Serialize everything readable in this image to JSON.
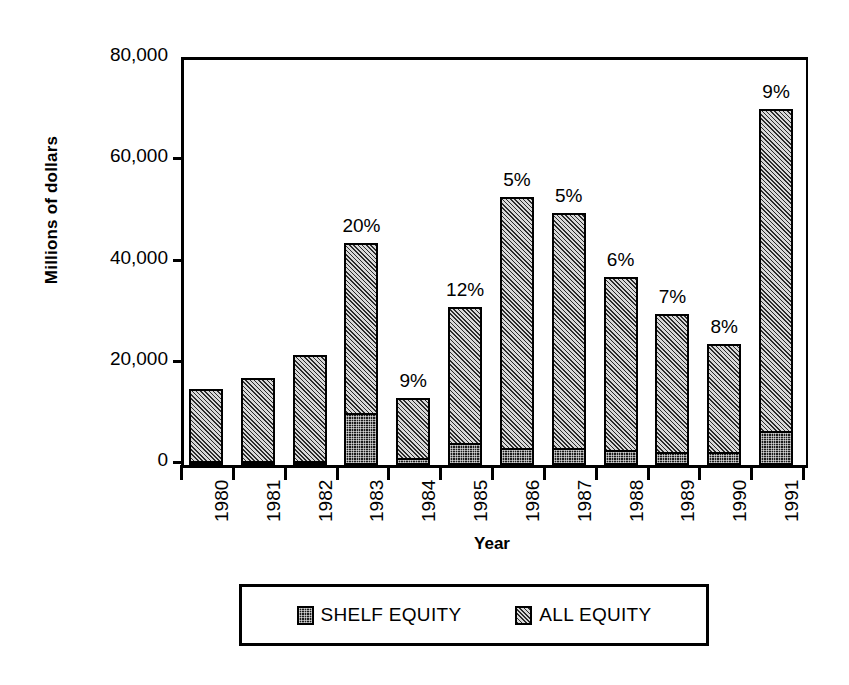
{
  "chart_data": {
    "type": "bar",
    "stacked": true,
    "title": "",
    "xlabel": "Year",
    "ylabel": "Millions of dollars",
    "categories": [
      "1980",
      "1981",
      "1982",
      "1983",
      "1984",
      "1985",
      "1986",
      "1987",
      "1988",
      "1989",
      "1990",
      "1991"
    ],
    "ylim": [
      0,
      80000
    ],
    "yticks": [
      0,
      20000,
      40000,
      60000,
      80000
    ],
    "ytick_labels": [
      "0",
      "20,000",
      "40,000",
      "60,000",
      "80,000"
    ],
    "grid": false,
    "legend_position": "below-plot",
    "series": [
      {
        "name": "SHELF EQUITY",
        "fill": "dark-dotted",
        "values": [
          400,
          300,
          400,
          10300,
          1400,
          4300,
          3400,
          3300,
          2900,
          2600,
          2600,
          6700
        ]
      },
      {
        "name": "ALL EQUITY",
        "fill": "diagonal-hatch",
        "values": [
          15100,
          17100,
          21700,
          43900,
          13200,
          31300,
          52900,
          49700,
          37100,
          29900,
          23900,
          70300
        ]
      }
    ],
    "totals": [
      15100,
      17100,
      21700,
      43900,
      13200,
      31300,
      52900,
      49700,
      37100,
      29900,
      23900,
      70300
    ],
    "bar_annotations": [
      "",
      "",
      "",
      "20%",
      "9%",
      "12%",
      "5%",
      "5%",
      "6%",
      "7%",
      "8%",
      "9%"
    ],
    "annotation_note": "percent labels show shelf equity share of all equity"
  },
  "legend": {
    "entries": [
      {
        "label": "SHELF EQUITY"
      },
      {
        "label": "ALL EQUITY"
      }
    ]
  },
  "colors": {
    "axis": "#000000",
    "background": "#ffffff",
    "shelf_equity": "#1b1b1b",
    "all_equity": "#8f8f8f"
  }
}
